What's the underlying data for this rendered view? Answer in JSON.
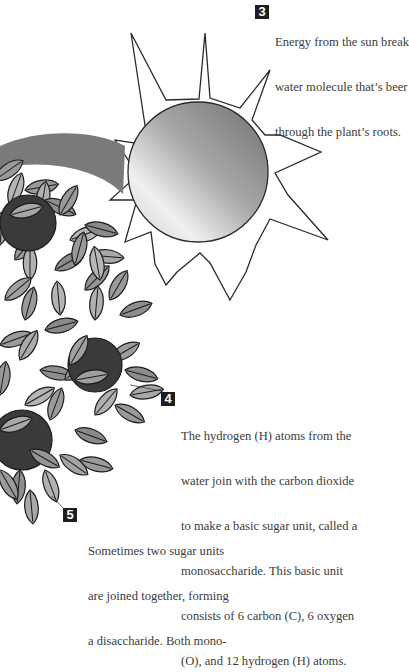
{
  "diagram": {
    "colors": {
      "badge": "#1e1e1e",
      "leaf_light": "#a8a8a8",
      "leaf_mid": "#8c8c8c",
      "leaf_outline": "#1c1c1c",
      "fruit_dark": "#3a3a3a",
      "energy_arrow": "#7a7a7a",
      "sun_outline": "#2a2a2a"
    },
    "steps": [
      {
        "number": "3",
        "lines": [
          "Energy from the sun break",
          "water molecule that’s beer",
          "through the plant’s roots."
        ]
      },
      {
        "number": "4",
        "lines": [
          "The hydrogen (H) atoms from the",
          "water join with the carbon dioxide",
          "to make a basic sugar unit, called a",
          "monosaccharide. This basic unit",
          "consists of 6 carbon (C), 6 oxygen",
          "(O), and 12 hydrogen (H) atoms."
        ]
      },
      {
        "number": "5",
        "lines": [
          "Sometimes two sugar units",
          "are joined together, forming",
          "a disaccharide. Both mono-"
        ]
      }
    ],
    "illustration": {
      "sun": "sun-with-gradient-disc-and-triangular-rays",
      "arrow": "curved-energy-arrow-from-sun-to-leaves",
      "plant": "leafy-plant-with-dark-round-fruits"
    }
  }
}
